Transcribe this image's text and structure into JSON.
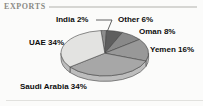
{
  "header": {
    "title": "EXPORTS"
  },
  "chart_data": {
    "type": "pie",
    "title": "EXPORTS",
    "effect": "3d",
    "direction": "clockwise",
    "start_angle_deg": -5,
    "legend_position": "callout-labels",
    "slices": [
      {
        "name": "India",
        "value": 2,
        "label": "India 2%",
        "color": "#8d8d8d"
      },
      {
        "name": "Other",
        "value": 6,
        "label": "Other 6%",
        "color": "#5e5e5e"
      },
      {
        "name": "Oman",
        "value": 8,
        "label": "Oman 8%",
        "color": "#898989"
      },
      {
        "name": "Yemen",
        "value": 16,
        "label": "Yemen 16%",
        "color": "#989898"
      },
      {
        "name": "Saudi Arabia",
        "value": 34,
        "label": "Saudi Arabia 34%",
        "color": "#a7a7a7"
      },
      {
        "name": "UAE",
        "value": 34,
        "label": "UAE 34%",
        "color": "#e3e3e1"
      }
    ],
    "rim_color": "#bdbdbd",
    "outline_color": "#454545"
  }
}
